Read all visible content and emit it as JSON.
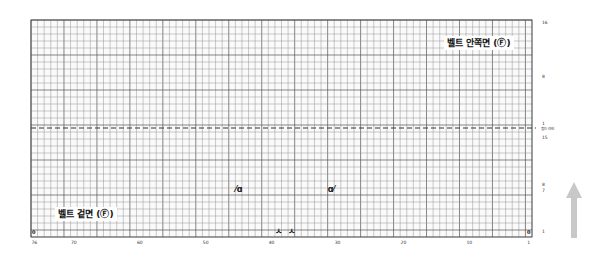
{
  "grid": {
    "columns": 76,
    "rows_total": 31,
    "left": 31,
    "top": 20,
    "right": 532,
    "bottom": 237,
    "fold_row_y": 128,
    "line_color": "#8a8a8a",
    "major_color": "#555555",
    "fold_line_color": "#333333"
  },
  "sections": {
    "inner": {
      "label": "벨트 안쪽면 (Ⓕ)"
    },
    "outer": {
      "label": "벨트 겉면 (Ⓕ)"
    }
  },
  "fold_line_label": "접는 라인",
  "row_labels": {
    "top_16": "16",
    "top_8": "8",
    "top_1": "1",
    "bottom_15": "15",
    "bottom_8": "8",
    "bottom_7": "7",
    "bottom_1": "1"
  },
  "column_labels": [
    {
      "text": "76",
      "col": 76
    },
    {
      "text": "70",
      "col": 70
    },
    {
      "text": "60",
      "col": 60
    },
    {
      "text": "50",
      "col": 50
    },
    {
      "text": "40",
      "col": 40
    },
    {
      "text": "30",
      "col": 30
    },
    {
      "text": "20",
      "col": 20
    },
    {
      "text": "10",
      "col": 10
    },
    {
      "text": "1",
      "col": 1
    }
  ],
  "corner_marks": {
    "left": "0",
    "right": "0"
  },
  "symbols": [
    {
      "name": "decrease-left-symbol",
      "glyph": "⋌",
      "text": "ᨈ",
      "display": "⁄ɑ",
      "col": 45,
      "row_y": 190
    },
    {
      "name": "decrease-right-symbol",
      "display": "ɑ⁄",
      "col": 31,
      "row_y": 190
    },
    {
      "name": "bind-symbol-a",
      "display": "ㅅ",
      "col": 39,
      "row_y": 232
    },
    {
      "name": "bind-symbol-b",
      "display": "ㅅ",
      "col": 37,
      "row_y": 232
    }
  ],
  "direction_arrow": {
    "direction": "up",
    "color": "#c8c8c8"
  }
}
